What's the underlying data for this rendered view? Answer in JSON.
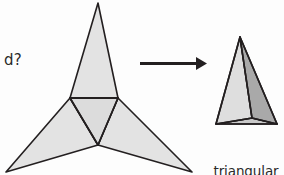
{
  "figure": {
    "type": "geometry-net-to-solid",
    "background_color": "#fdfdfd",
    "stroke_color": "#231f20",
    "prompt_label": "d?",
    "arrow": {
      "name": "fold-arrow",
      "direction": "right",
      "color": "#231f20",
      "x_start": 140,
      "x_end": 206,
      "y": 63
    },
    "net": {
      "name": "triangular-pyramid-net",
      "fill_face": "#e3e3e3",
      "fill_base": "#dcdcdc",
      "stroke": "#231f20",
      "center_triangle": [
        [
          70,
          98
        ],
        [
          118,
          98
        ],
        [
          98,
          145
        ]
      ],
      "flap_top": [
        [
          70,
          98
        ],
        [
          118,
          98
        ],
        [
          98,
          3
        ]
      ],
      "flap_left": [
        [
          70,
          98
        ],
        [
          98,
          145
        ],
        [
          6,
          172
        ]
      ],
      "flap_right": [
        [
          118,
          98
        ],
        [
          98,
          145
        ],
        [
          192,
          172
        ]
      ]
    },
    "solid": {
      "name": "triangular-pyramid-solid",
      "apex": [
        240,
        37
      ],
      "base_left": [
        216,
        124
      ],
      "base_right": [
        277,
        124
      ],
      "base_front": [
        252,
        118
      ],
      "face_left_fill": "#dedede",
      "face_right_fill": "#a9a9a9",
      "base_fill": "#c9c9c9",
      "stroke": "#231f20"
    },
    "caption": {
      "line1": "triangular",
      "line2": "pyramid"
    }
  }
}
